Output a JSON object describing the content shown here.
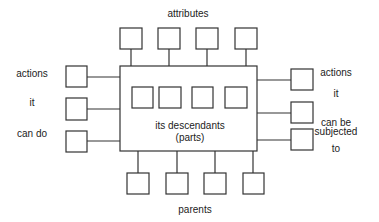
{
  "diagram": {
    "title_top": "attributes",
    "title_bottom": "parents",
    "center_text": [
      "its descendants",
      "(parts)"
    ],
    "left_labels": [
      "actions",
      "it",
      "can do"
    ],
    "right_labels": [
      "actions",
      "it",
      "can be",
      "subjected",
      "to"
    ],
    "top_boxes_count": 4,
    "bottom_boxes_count": 4,
    "inner_boxes_count": 4,
    "left_boxes_count": 3,
    "right_boxes_count": 3,
    "colors": {
      "stroke": "#333333",
      "text": "#222222",
      "background": "#ffffff"
    }
  }
}
